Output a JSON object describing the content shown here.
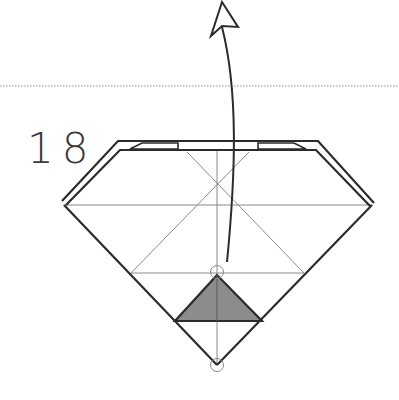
{
  "diagram": {
    "type": "origami-step",
    "step_number": "18",
    "colors": {
      "line": "#2b2b2b",
      "crease": "#8a8a8a",
      "flap_fill": "#8c8c8c",
      "dotted": "#8a8a8a",
      "background": "#ffffff"
    },
    "annotations": {
      "fold_line": "dotted valley line",
      "arrow": "curved fold-up arrow",
      "reference_points": [
        "triangle-apex",
        "bottom-point"
      ]
    }
  }
}
